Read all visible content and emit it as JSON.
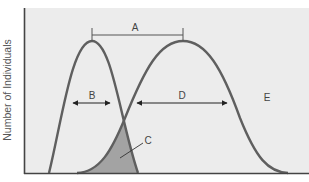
{
  "figure": {
    "y_axis_label": "Number of Individuals",
    "x_axis_label": "",
    "labels": {
      "A": "A",
      "B": "B",
      "C": "C",
      "D": "D",
      "E": "E"
    },
    "curves": [
      {
        "name": "narrow-distribution",
        "peak_x": 92,
        "base_left": 49,
        "base_right": 138
      },
      {
        "name": "wide-distribution",
        "peak_x": 183,
        "base_left": 77,
        "base_right": 288
      }
    ],
    "colors": {
      "plot_background": "#ececec",
      "curve": "#5f5f5f",
      "overlap_fill": "#a3a3a3",
      "axis": "#444444",
      "annotation": "#333333"
    }
  }
}
